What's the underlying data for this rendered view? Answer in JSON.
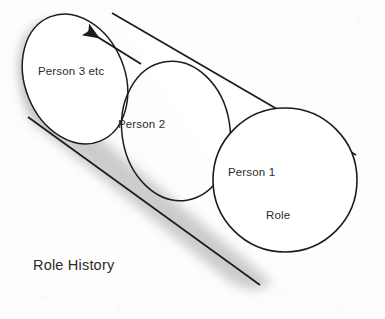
{
  "diagram": {
    "title": "Role History",
    "type": "cylinder-timeline",
    "caption": {
      "text": "Role History"
    },
    "labels": [
      {
        "id": "person-3-etc",
        "text": "Person 3 etc"
      },
      {
        "id": "person-2",
        "text": "Person 2"
      },
      {
        "id": "person-1",
        "text": "Person 1"
      },
      {
        "id": "role",
        "text": "Role"
      }
    ],
    "arrow": {
      "name": "history-direction-arrow",
      "direction": "up-left",
      "meaning": "direction of history / earlier in time"
    },
    "colors": {
      "background": "#fdfdfd",
      "stroke": "#1c1c1c",
      "fill": "#ffffff",
      "shadow": "#b9b9b9",
      "text": "#2b2b2b"
    }
  }
}
